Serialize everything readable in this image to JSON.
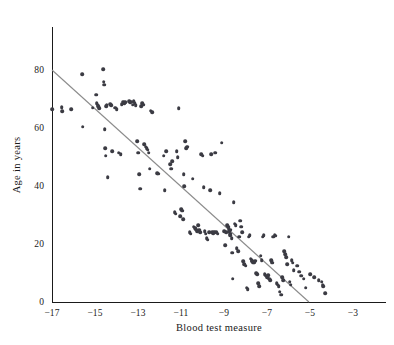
{
  "chart_data": {
    "type": "scatter",
    "title": "",
    "xlabel": "Blood test measure",
    "ylabel": "Age in years",
    "xlim": [
      -17.5,
      -2.5
    ],
    "ylim": [
      0,
      88
    ],
    "grid": false,
    "legend": "none",
    "x_ticks_major": [
      -17,
      -15,
      -13,
      -11,
      -9,
      -7,
      -5,
      -3
    ],
    "x_tick_labels": [
      "−17",
      "−15",
      "−13",
      "−11",
      "−9",
      "−7",
      "−5",
      "−3"
    ],
    "x_ticks_minor": [
      -16.5,
      -16,
      -15.5,
      -14.5,
      -14,
      -13.5,
      -12.5,
      -12,
      -11.5,
      -10.5,
      -10,
      -9.5,
      -8.5,
      -8,
      -7.5,
      -6.5,
      -6,
      -5.5,
      -4.5,
      -4,
      -3.5
    ],
    "y_ticks_major": [
      0,
      20,
      40,
      60,
      80
    ],
    "y_tick_labels": [
      "0",
      "20",
      "40",
      "60",
      "80"
    ],
    "y_ticks_minor": [
      5,
      10,
      15,
      25,
      30,
      35,
      45,
      50,
      55,
      65,
      70,
      75,
      85
    ],
    "marker_color": "#3b3b43",
    "marker_size_px": 3.6,
    "fit_line": {
      "color": "#8c8c8c",
      "label": "linear fit",
      "x_start": -17.0,
      "y_start": 80.0,
      "x_end": -5.05,
      "y_end": 0.0,
      "slope": -6.7,
      "intercept": -33.9
    },
    "points": [
      [
        -17.0,
        66.5
      ],
      [
        -16.55,
        67.2
      ],
      [
        -16.52,
        65.8
      ],
      [
        -16.1,
        66.5
      ],
      [
        -15.6,
        78.5
      ],
      [
        -15.58,
        60.5
      ],
      [
        -15.1,
        67.0
      ],
      [
        -14.95,
        71.5
      ],
      [
        -14.92,
        68.5
      ],
      [
        -14.88,
        68.0
      ],
      [
        -14.85,
        67.6
      ],
      [
        -14.8,
        66.8
      ],
      [
        -14.62,
        80.2
      ],
      [
        -14.6,
        76.0
      ],
      [
        -14.58,
        75.0
      ],
      [
        -14.55,
        59.5
      ],
      [
        -14.52,
        53.0
      ],
      [
        -14.5,
        50.5
      ],
      [
        -14.48,
        67.5
      ],
      [
        -14.45,
        68.0
      ],
      [
        -14.4,
        43.0
      ],
      [
        -14.3,
        68.2
      ],
      [
        -14.25,
        67.8
      ],
      [
        -14.2,
        52.0
      ],
      [
        -14.05,
        67.0
      ],
      [
        -14.0,
        66.5
      ],
      [
        -13.9,
        51.5
      ],
      [
        -13.8,
        51.0
      ],
      [
        -13.75,
        68.2
      ],
      [
        -13.7,
        69.0
      ],
      [
        -13.65,
        68.5
      ],
      [
        -13.6,
        68.8
      ],
      [
        -13.4,
        69.3
      ],
      [
        -13.35,
        68.8
      ],
      [
        -13.3,
        69.0
      ],
      [
        -13.25,
        68.0
      ],
      [
        -13.2,
        69.2
      ],
      [
        -13.15,
        68.5
      ],
      [
        -13.1,
        67.8
      ],
      [
        -13.05,
        55.5
      ],
      [
        -13.0,
        51.5
      ],
      [
        -12.95,
        44.0
      ],
      [
        -12.9,
        39.0
      ],
      [
        -12.85,
        67.5
      ],
      [
        -12.8,
        68.5
      ],
      [
        -12.75,
        68.0
      ],
      [
        -12.7,
        54.5
      ],
      [
        -12.65,
        53.5
      ],
      [
        -12.6,
        53.0
      ],
      [
        -12.55,
        52.5
      ],
      [
        -12.5,
        51.5
      ],
      [
        -12.45,
        46.0
      ],
      [
        -12.4,
        66.0
      ],
      [
        -12.35,
        65.5
      ],
      [
        -12.1,
        44.5
      ],
      [
        -12.05,
        44.2
      ],
      [
        -11.8,
        50.5
      ],
      [
        -11.75,
        38.5
      ],
      [
        -11.7,
        52.0
      ],
      [
        -11.5,
        47.5
      ],
      [
        -11.45,
        46.0
      ],
      [
        -11.4,
        48.5
      ],
      [
        -11.3,
        31.0
      ],
      [
        -11.25,
        30.5
      ],
      [
        -11.2,
        52.0
      ],
      [
        -11.15,
        50.0
      ],
      [
        -11.1,
        66.8
      ],
      [
        -11.05,
        29.5
      ],
      [
        -11.0,
        32.0
      ],
      [
        -10.95,
        31.5
      ],
      [
        -10.9,
        28.5
      ],
      [
        -10.88,
        44.0
      ],
      [
        -10.85,
        40.0
      ],
      [
        -10.8,
        55.5
      ],
      [
        -10.75,
        53.0
      ],
      [
        -10.72,
        53.5
      ],
      [
        -10.6,
        24.0
      ],
      [
        -10.55,
        23.5
      ],
      [
        -10.45,
        42.5
      ],
      [
        -10.4,
        26.0
      ],
      [
        -10.35,
        25.5
      ],
      [
        -10.3,
        25.0
      ],
      [
        -10.25,
        24.5
      ],
      [
        -10.2,
        26.5
      ],
      [
        -10.15,
        25.0
      ],
      [
        -10.1,
        24.0
      ],
      [
        -10.05,
        51.0
      ],
      [
        -10.0,
        50.5
      ],
      [
        -9.95,
        39.5
      ],
      [
        -9.9,
        24.5
      ],
      [
        -9.85,
        23.5
      ],
      [
        -9.8,
        22.0
      ],
      [
        -9.75,
        21.5
      ],
      [
        -9.7,
        24.0
      ],
      [
        -9.65,
        38.5
      ],
      [
        -9.6,
        51.0
      ],
      [
        -9.55,
        24.0
      ],
      [
        -9.5,
        23.8
      ],
      [
        -9.45,
        24.2
      ],
      [
        -9.4,
        51.5
      ],
      [
        -9.35,
        24.0
      ],
      [
        -9.3,
        23.5
      ],
      [
        -9.2,
        37.5
      ],
      [
        -9.1,
        55.0
      ],
      [
        -9.0,
        24.5
      ],
      [
        -8.95,
        19.5
      ],
      [
        -8.9,
        24.0
      ],
      [
        -8.85,
        26.5
      ],
      [
        -8.8,
        26.0
      ],
      [
        -8.78,
        25.5
      ],
      [
        -8.75,
        24.5
      ],
      [
        -8.72,
        23.5
      ],
      [
        -8.7,
        23.0
      ],
      [
        -8.68,
        25.0
      ],
      [
        -8.65,
        22.0
      ],
      [
        -8.62,
        17.0
      ],
      [
        -8.6,
        8.0
      ],
      [
        -8.55,
        34.5
      ],
      [
        -8.5,
        27.0
      ],
      [
        -8.45,
        26.5
      ],
      [
        -8.4,
        18.5
      ],
      [
        -8.35,
        17.5
      ],
      [
        -8.3,
        22.5
      ],
      [
        -8.25,
        28.0
      ],
      [
        -8.2,
        26.0
      ],
      [
        -8.15,
        24.0
      ],
      [
        -8.1,
        14.0
      ],
      [
        -8.05,
        13.0
      ],
      [
        -8.0,
        12.5
      ],
      [
        -7.95,
        5.0
      ],
      [
        -7.9,
        4.5
      ],
      [
        -7.85,
        22.5
      ],
      [
        -7.8,
        23.0
      ],
      [
        -7.75,
        15.0
      ],
      [
        -7.72,
        14.5
      ],
      [
        -7.7,
        14.0
      ],
      [
        -7.65,
        13.5
      ],
      [
        -7.6,
        13.8
      ],
      [
        -7.55,
        14.2
      ],
      [
        -7.5,
        10.0
      ],
      [
        -7.45,
        9.5
      ],
      [
        -7.4,
        6.5
      ],
      [
        -7.35,
        5.5
      ],
      [
        -7.3,
        16.0
      ],
      [
        -7.25,
        14.5
      ],
      [
        -7.2,
        22.5
      ],
      [
        -7.15,
        23.0
      ],
      [
        -7.1,
        9.5
      ],
      [
        -7.05,
        9.0
      ],
      [
        -7.0,
        8.5
      ],
      [
        -6.95,
        9.2
      ],
      [
        -6.9,
        8.0
      ],
      [
        -6.85,
        7.5
      ],
      [
        -6.8,
        14.5
      ],
      [
        -6.78,
        14.0
      ],
      [
        -6.75,
        13.5
      ],
      [
        -6.7,
        22.5
      ],
      [
        -6.65,
        23.0
      ],
      [
        -6.6,
        22.8
      ],
      [
        -6.55,
        6.5
      ],
      [
        -6.5,
        6.0
      ],
      [
        -6.45,
        5.5
      ],
      [
        -6.4,
        3.5
      ],
      [
        -6.35,
        2.5
      ],
      [
        -6.3,
        8.5
      ],
      [
        -6.25,
        7.5
      ],
      [
        -6.2,
        17.5
      ],
      [
        -6.15,
        16.5
      ],
      [
        -6.1,
        15.5
      ],
      [
        -6.05,
        13.0
      ],
      [
        -6.0,
        22.5
      ],
      [
        -5.95,
        7.0
      ],
      [
        -5.9,
        6.0
      ],
      [
        -5.85,
        14.5
      ],
      [
        -5.8,
        13.5
      ],
      [
        -5.75,
        11.0
      ],
      [
        -5.6,
        12.5
      ],
      [
        -5.5,
        10.5
      ],
      [
        -5.4,
        9.0
      ],
      [
        -5.3,
        8.0
      ],
      [
        -5.2,
        5.0
      ],
      [
        -5.0,
        9.5
      ],
      [
        -4.8,
        8.5
      ],
      [
        -4.6,
        7.5
      ],
      [
        -4.45,
        7.0
      ],
      [
        -4.4,
        6.0
      ],
      [
        -4.38,
        5.5
      ],
      [
        -4.3,
        3.0
      ]
    ]
  }
}
